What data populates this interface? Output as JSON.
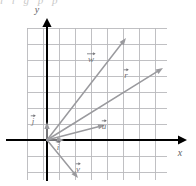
{
  "figure": {
    "type": "vector-diagram",
    "width": 196,
    "height": 186,
    "background_color": "#ffffff",
    "cutoff_caption": "l   i   g   p   p",
    "axes": {
      "x_label": "x",
      "y_label": "y",
      "axis_color": "#000000",
      "origin": {
        "x": 47,
        "y": 140
      },
      "x_axis": {
        "x1": 6,
        "y1": 140,
        "x2": 187,
        "y2": 140,
        "arrow": "right"
      },
      "y_axis": {
        "x1": 47,
        "y1": 181,
        "x2": 47,
        "y2": 18,
        "arrow": "up"
      }
    },
    "grid": {
      "color": "#b9b9bd",
      "cell_size": 16,
      "left": 27,
      "top": 28,
      "right": 167,
      "bottom": 180,
      "cols": 9,
      "rows": 10,
      "visible": true
    },
    "vector_color": "#9a9a9e",
    "label_color": "#6f6f74"
  },
  "chart_data": {
    "type": "scatter",
    "title": "",
    "xlabel": "x",
    "ylabel": "y",
    "grid": true,
    "legend": "none",
    "xlim": [
      -1.25,
      7.5
    ],
    "ylim": [
      -2.5,
      7.0
    ],
    "origin_px": {
      "x": 47,
      "y": 140
    },
    "unit_px": 16,
    "vectors": [
      {
        "name": "j",
        "label": "j",
        "tail": {
          "x": 0,
          "y": 0
        },
        "head": {
          "x": 0,
          "y": 1.1
        },
        "tail_px": {
          "x": 47,
          "y": 140
        },
        "head_px": {
          "x": 47,
          "y": 122
        },
        "label_px": {
          "x": 33,
          "y": 124
        }
      },
      {
        "name": "i",
        "label": "i",
        "tail": {
          "x": 0,
          "y": 0
        },
        "head": {
          "x": 1.0,
          "y": 0
        },
        "tail_px": {
          "x": 47,
          "y": 140
        },
        "head_px": {
          "x": 64,
          "y": 140
        },
        "label_px": {
          "x": 58,
          "y": 150
        }
      },
      {
        "name": "u",
        "label": "u",
        "tail": {
          "x": 0,
          "y": 0
        },
        "head": {
          "x": 3.6,
          "y": 0.95
        },
        "tail_px": {
          "x": 47,
          "y": 140
        },
        "head_px": {
          "x": 105,
          "y": 125
        },
        "label_px": {
          "x": 104,
          "y": 129
        }
      },
      {
        "name": "r",
        "label": "r",
        "tail": {
          "x": 0,
          "y": 0
        },
        "head": {
          "x": 7.25,
          "y": 4.5
        },
        "tail_px": {
          "x": 47,
          "y": 140
        },
        "head_px": {
          "x": 163,
          "y": 68
        },
        "label_px": {
          "x": 126,
          "y": 78
        }
      },
      {
        "name": "w",
        "label": "w",
        "tail": {
          "x": 0,
          "y": 0
        },
        "head": {
          "x": 4.95,
          "y": 6.4
        },
        "tail_px": {
          "x": 47,
          "y": 140
        },
        "head_px": {
          "x": 126,
          "y": 38
        },
        "label_px": {
          "x": 91,
          "y": 62
        }
      },
      {
        "name": "v",
        "label": "v",
        "tail": {
          "x": 0,
          "y": 0
        },
        "head": {
          "x": 1.95,
          "y": -2.35
        },
        "tail_px": {
          "x": 47,
          "y": 140
        },
        "head_px": {
          "x": 78,
          "y": 178
        },
        "label_px": {
          "x": 78,
          "y": 172
        }
      }
    ]
  }
}
